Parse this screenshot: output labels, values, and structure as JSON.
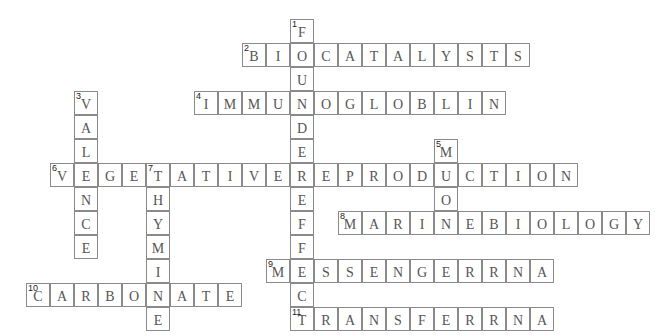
{
  "puzzle": {
    "cell_size": 24,
    "origin_x": 2,
    "origin_y": 19,
    "border_color": "#8a8a8a",
    "letter_color": "#555555",
    "entries": [
      {
        "number": "1",
        "direction": "down",
        "answer": "FOUNDEREFFECT",
        "col": 12,
        "row": 0
      },
      {
        "number": "2",
        "direction": "across",
        "answer": "BIOCATALYSTS",
        "col": 10,
        "row": 1
      },
      {
        "number": "3",
        "direction": "down",
        "answer": "VALENCE",
        "col": 3,
        "row": 3
      },
      {
        "number": "4",
        "direction": "across",
        "answer": "IMMUNOGLOBLIN",
        "col": 8,
        "row": 3
      },
      {
        "number": "5",
        "direction": "down",
        "answer": "MUON",
        "col": 18,
        "row": 5
      },
      {
        "number": "6",
        "direction": "across",
        "answer": "VEGETATIVEREPRODUCTION",
        "col": 2,
        "row": 6
      },
      {
        "number": "7",
        "direction": "down",
        "answer": "THYMINE",
        "col": 6,
        "row": 6
      },
      {
        "number": "8",
        "direction": "across",
        "answer": "MARINEBIOLOGY",
        "col": 14,
        "row": 8
      },
      {
        "number": "9",
        "direction": "across",
        "answer": "MESSENGERRNA",
        "col": 11,
        "row": 10
      },
      {
        "number": "10",
        "direction": "across",
        "answer": "CARBONATE",
        "col": 1,
        "row": 11
      },
      {
        "number": "11",
        "direction": "across",
        "answer": "TRANSFERRNA",
        "col": 12,
        "row": 12
      }
    ]
  }
}
